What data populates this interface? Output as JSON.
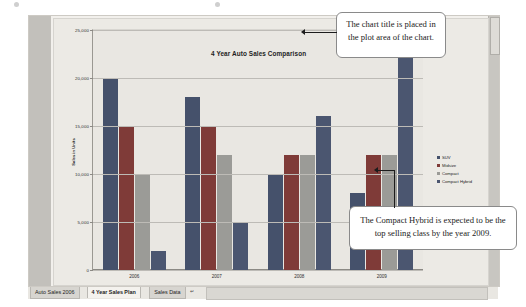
{
  "chart_data": {
    "type": "bar",
    "title": "4 Year Auto Sales Comparison",
    "xlabel": "Fiscal Year",
    "ylabel": "Sales in Units",
    "ylim": [
      0,
      25000
    ],
    "ytick_labels": [
      "25,000",
      "20,000",
      "15,000",
      "10,000",
      "5,000",
      "0"
    ],
    "ytick_values": [
      25000,
      20000,
      15000,
      10000,
      5000,
      0
    ],
    "grid": true,
    "legend_position": "right",
    "categories": [
      "2006",
      "2007",
      "2008",
      "2009"
    ],
    "series": [
      {
        "name": "SUV",
        "color": "#45516b",
        "values": [
          20000,
          18000,
          10000,
          8000
        ]
      },
      {
        "name": "Midsize",
        "color": "#7f3b38",
        "values": [
          15000,
          15000,
          12000,
          12000
        ]
      },
      {
        "name": "Compact",
        "color": "#9b9b97",
        "values": [
          10000,
          12000,
          12000,
          12000
        ]
      },
      {
        "name": "Compact Hybrid",
        "color": "#4b5670",
        "values": [
          2000,
          5000,
          16000,
          25000
        ]
      }
    ]
  },
  "annotations": [
    {
      "id": "chart-title-callout",
      "text": "The chart title is placed in the plot area of the chart."
    },
    {
      "id": "compact-hybrid-callout",
      "text": "The Compact Hybrid is expected to be the top selling class by the year 2009."
    }
  ],
  "tabbar": {
    "tabs": [
      {
        "label": "Auto Sales 2006",
        "active": false
      },
      {
        "label": "4 Year Sales Plan",
        "active": true
      },
      {
        "label": "Sales Data",
        "active": false
      }
    ],
    "new_sheet_icon": "new-sheet-icon"
  },
  "icons": {
    "vertical_scrollbar": "vertical-scrollbar",
    "arrow_marker": "arrow-left-icon"
  }
}
